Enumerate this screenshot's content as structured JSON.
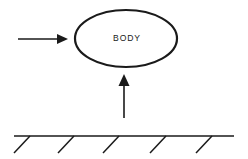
{
  "canvas": {
    "width": 248,
    "height": 159,
    "background_color": "#ffffff",
    "ink_color": "#1a1a1a"
  },
  "diagram": {
    "kind": "free-body-diagram",
    "body": {
      "shape": "ellipse",
      "label": "BODY",
      "center_x": 126,
      "center_y": 38.5,
      "radius_x": 51,
      "radius_y": 28.5,
      "stroke_width": 2.2,
      "fill_color": "#ffffff",
      "stroke_color": "#1a1a1a"
    },
    "arrows": [
      {
        "name": "horizontal-force-arrow",
        "direction": "right",
        "label": "",
        "tail_x": 18,
        "tail_y": 39,
        "tip_x": 68,
        "tip_y": 39,
        "head_length": 11,
        "head_half_width": 5,
        "shaft_width": 1.6
      },
      {
        "name": "vertical-force-arrow",
        "direction": "up",
        "label": "",
        "tail_x": 124,
        "tail_y": 118,
        "tip_x": 124,
        "tip_y": 74,
        "head_length": 12,
        "head_half_width": 5.5,
        "shaft_width": 1.6
      }
    ],
    "ground": {
      "name": "ground-surface",
      "line_start_x": 14,
      "line_end_x": 234,
      "line_y": 136,
      "stroke_width": 1.7,
      "hatch_count": 5,
      "hatch_dx": -16,
      "hatch_dy": 17,
      "hatch_stroke_width": 1.5,
      "hatch_top_x": [
        30,
        74,
        119,
        166,
        212
      ]
    }
  }
}
